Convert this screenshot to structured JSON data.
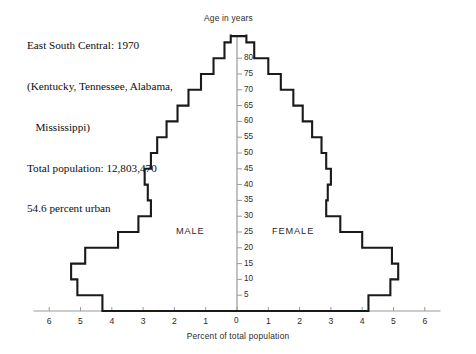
{
  "caption": {
    "lines": [
      "East South Central: 1970",
      "(Kentucky, Tennessee, Alabama,",
      "   Mississippi)",
      "Total population: 12,803,470",
      "54.6 percent urban"
    ]
  },
  "labels": {
    "male": "MALE",
    "female": "FEMALE",
    "y_axis_title": "Age in years",
    "x_axis_title": "Percent of total population"
  },
  "chart_data": {
    "type": "bar",
    "orientation": "population-pyramid",
    "title": "East South Central: 1970",
    "subtitle": "(Kentucky, Tennessee, Alabama, Mississippi)",
    "total_population": "12,803,470",
    "percent_urban": "54.6 percent urban",
    "xlabel": "Percent of total population",
    "ylabel": "Age in years",
    "xlim": [
      -6.5,
      6.5
    ],
    "ylim": [
      0,
      87.5
    ],
    "grid": false,
    "legend": false,
    "x_tick_labels": [
      "6",
      "5",
      "4",
      "3",
      "2",
      "1",
      "0",
      "1",
      "2",
      "3",
      "4",
      "5",
      "6"
    ],
    "x_tick_values": [
      -6,
      -5,
      -4,
      -3,
      -2,
      -1,
      0,
      1,
      2,
      3,
      4,
      5,
      6
    ],
    "y_tick_labels": [
      "0",
      "5",
      "10",
      "15",
      "20",
      "25",
      "30",
      "35",
      "40",
      "45",
      "50",
      "55",
      "60",
      "65",
      "70",
      "75",
      "80"
    ],
    "y_tick_values": [
      0,
      5,
      10,
      15,
      20,
      25,
      30,
      35,
      40,
      45,
      50,
      55,
      60,
      65,
      70,
      75,
      80
    ],
    "age_groups": [
      "0-4",
      "5-9",
      "10-14",
      "15-19",
      "20-24",
      "25-29",
      "30-34",
      "35-39",
      "40-44",
      "45-49",
      "50-54",
      "55-59",
      "60-64",
      "65-69",
      "70-74",
      "75-79",
      "80-84",
      "85+"
    ],
    "age_group_lower": [
      0,
      5,
      10,
      15,
      20,
      25,
      30,
      35,
      40,
      45,
      50,
      55,
      60,
      65,
      70,
      75,
      80,
      85
    ],
    "series": [
      {
        "name": "MALE",
        "side": "left",
        "values": [
          4.3,
          5.1,
          5.3,
          4.85,
          3.8,
          3.15,
          2.75,
          2.85,
          2.95,
          2.75,
          2.55,
          2.25,
          1.9,
          1.55,
          1.15,
          0.75,
          0.4,
          0.2
        ]
      },
      {
        "name": "FEMALE",
        "side": "right",
        "values": [
          4.2,
          4.9,
          5.15,
          4.95,
          4.0,
          3.3,
          2.85,
          2.9,
          3.0,
          2.85,
          2.7,
          2.4,
          2.1,
          1.8,
          1.4,
          1.0,
          0.55,
          0.3
        ]
      }
    ]
  },
  "geometry": {
    "x_zero_px": 237,
    "px_per_unit": 31.3,
    "y_base_px": 311,
    "px_per_year": 3.16,
    "line_color": "#1a1a1a",
    "axis_color": "#9a9a9a"
  }
}
